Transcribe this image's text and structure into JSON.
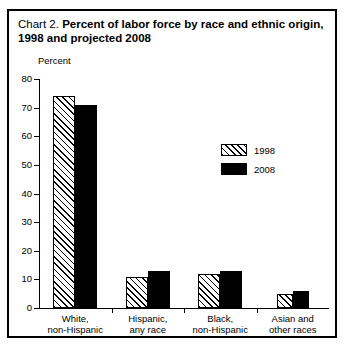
{
  "title": {
    "prefix": "Chart 2.",
    "main": "Percent of labor force by race and ethnic origin, 1998 and projected 2008"
  },
  "chart_data": {
    "type": "bar",
    "title": "Chart 2. Percent of labor force by race and ethnic origin, 1998 and projected 2008",
    "xlabel": "",
    "ylabel": "Percent",
    "ylim": [
      0,
      80
    ],
    "yticks": [
      0,
      10,
      20,
      30,
      40,
      50,
      60,
      70,
      80
    ],
    "grid": false,
    "legend_position": "inside-upper-right",
    "categories": [
      "White, non-Hispanic",
      "Hispanic, any race",
      "Black, non-Hispanic",
      "Asian and other races"
    ],
    "category_lines": [
      [
        "White,",
        "non-Hispanic"
      ],
      [
        "Hispanic,",
        "any race"
      ],
      [
        "Black,",
        "non-Hispanic"
      ],
      [
        "Asian and",
        "other races"
      ]
    ],
    "series": [
      {
        "name": "1998",
        "values": [
          74,
          11,
          12,
          5
        ],
        "fill": "hatched"
      },
      {
        "name": "2008",
        "values": [
          71,
          13,
          13,
          6
        ],
        "fill": "solid-black"
      }
    ]
  },
  "legend": {
    "items": [
      {
        "label": "1998",
        "swatch": "hatched-swatch"
      },
      {
        "label": "2008",
        "swatch": "solid-black-swatch"
      }
    ]
  },
  "colors": {
    "ink": "#000000",
    "background": "#ffffff"
  }
}
